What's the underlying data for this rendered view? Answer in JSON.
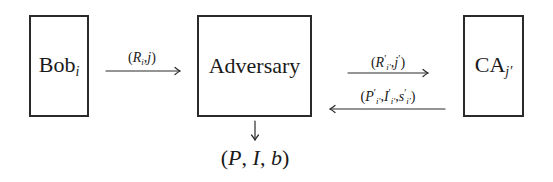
{
  "diagram": {
    "type": "protocol-flow",
    "nodes": [
      {
        "id": "bob",
        "label": "Bob",
        "subscript": "i"
      },
      {
        "id": "adversary",
        "label": "Adversary",
        "subscript": ""
      },
      {
        "id": "ca",
        "label": "CA",
        "subscript": "j′"
      }
    ],
    "edges": [
      {
        "from": "bob",
        "to": "adversary",
        "label": "(R_i, j)"
      },
      {
        "from": "adversary",
        "to": "ca",
        "label": "(R′_i′, j′)"
      },
      {
        "from": "ca",
        "to": "adversary",
        "label": "(P′_i′, I′_i′, s′_i′)"
      },
      {
        "from": "adversary",
        "to": "output",
        "label": ""
      }
    ],
    "output": {
      "label": "(P, I, b)"
    }
  },
  "nodes": {
    "bob": {
      "name": "Bob",
      "sub": "i"
    },
    "adversary": {
      "name": "Adversary"
    },
    "ca": {
      "name": "CA",
      "sub": "j′"
    }
  },
  "output_text": "(P, I, b)"
}
